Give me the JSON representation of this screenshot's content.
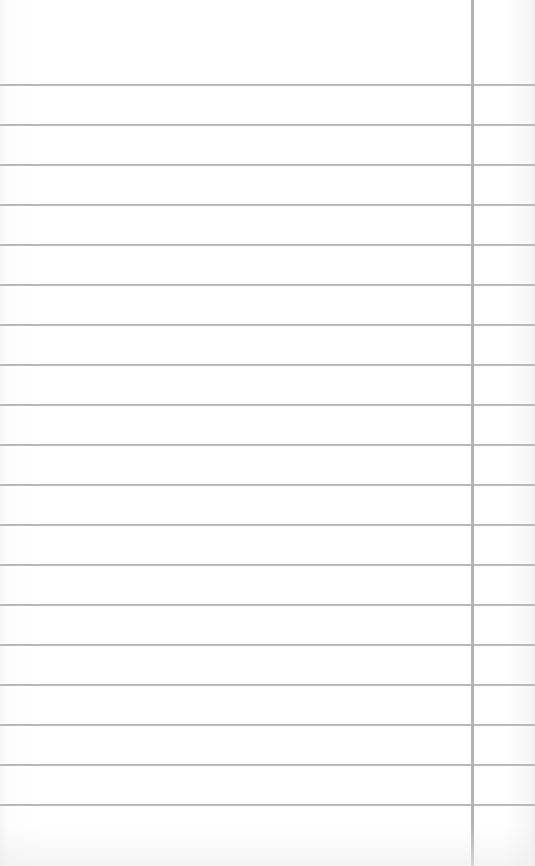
{
  "paper": {
    "type": "lined-notebook-page",
    "background_color": "#ffffff",
    "rule_color": "#b9b9b9",
    "margin_line_color": "#b3b3b3",
    "margin_line_x": 471,
    "rule_count": 19,
    "first_rule_y": 84,
    "rule_spacing": 40
  }
}
